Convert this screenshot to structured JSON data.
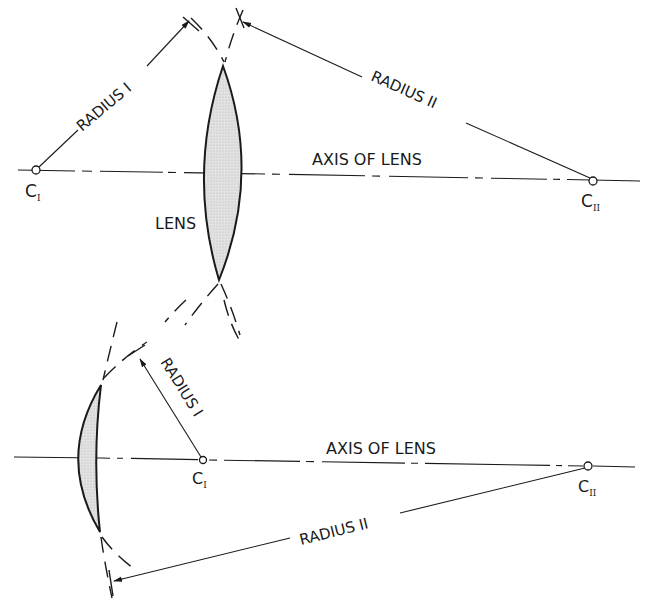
{
  "figure": {
    "top_lens": {
      "type": "double-convex",
      "axis_label": "AXIS OF LENS",
      "lens_label": "LENS",
      "radius_1_label": "RADIUS I",
      "radius_2_label": "RADIUS II",
      "center_1_label": "C",
      "center_1_sub": "I",
      "center_2_label": "C",
      "center_2_sub": "II"
    },
    "bottom_lens": {
      "type": "convex-meniscus",
      "axis_label": "AXIS OF LENS",
      "radius_1_label": "RADIUS I",
      "radius_2_label": "RADIUS II",
      "center_1_label": "C",
      "center_1_sub": "I",
      "center_2_label": "C",
      "center_2_sub": "II"
    },
    "colors": {
      "line": "#1a1a1a",
      "lens_fill": "#d9d9d9",
      "background": "#ffffff"
    }
  }
}
